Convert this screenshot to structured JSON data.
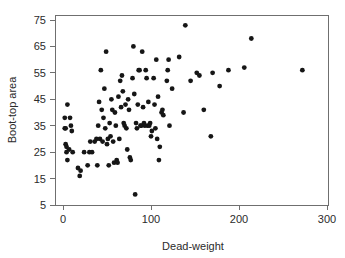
{
  "chart_data": {
    "type": "scatter",
    "title": "",
    "xlabel": "Dead-weight",
    "ylabel": "Boot-top area",
    "xlim": [
      0,
      300
    ],
    "ylim": [
      5,
      75
    ],
    "xticks": [
      0,
      100,
      200,
      300
    ],
    "yticks": [
      5,
      15,
      25,
      35,
      45,
      55,
      65,
      75
    ],
    "xtick_labels": [
      "0",
      "100",
      "200",
      "300"
    ],
    "ytick_labels": [
      "5",
      "15",
      "25",
      "35",
      "45",
      "55",
      "65",
      "75"
    ],
    "grid": false,
    "legend": false,
    "marker": "filled-circle",
    "marker_color": "#161616",
    "frame_color": "#6f6f6f",
    "n_points": 113,
    "series": [
      {
        "name": "observations",
        "points": [
          [
            2,
            38
          ],
          [
            2,
            34
          ],
          [
            3,
            34
          ],
          [
            3,
            28
          ],
          [
            4,
            27
          ],
          [
            4,
            25
          ],
          [
            5,
            43
          ],
          [
            5,
            22
          ],
          [
            7,
            26
          ],
          [
            8,
            38
          ],
          [
            9,
            35
          ],
          [
            10,
            33
          ],
          [
            11,
            25
          ],
          [
            17,
            19
          ],
          [
            19,
            16
          ],
          [
            20,
            18
          ],
          [
            24,
            25
          ],
          [
            28,
            20
          ],
          [
            30,
            25
          ],
          [
            31,
            29
          ],
          [
            33,
            25
          ],
          [
            36,
            29
          ],
          [
            38,
            30
          ],
          [
            39,
            20
          ],
          [
            40,
            35
          ],
          [
            41,
            44
          ],
          [
            42,
            30
          ],
          [
            43,
            56
          ],
          [
            44,
            41
          ],
          [
            45,
            29
          ],
          [
            46,
            38
          ],
          [
            47,
            49
          ],
          [
            48,
            34
          ],
          [
            49,
            63
          ],
          [
            50,
            28
          ],
          [
            51,
            30
          ],
          [
            52,
            20
          ],
          [
            53,
            36
          ],
          [
            54,
            31
          ],
          [
            55,
            45
          ],
          [
            56,
            41
          ],
          [
            57,
            29
          ],
          [
            58,
            21
          ],
          [
            59,
            40
          ],
          [
            60,
            35
          ],
          [
            61,
            22
          ],
          [
            62,
            21
          ],
          [
            63,
            46
          ],
          [
            64,
            30
          ],
          [
            65,
            52
          ],
          [
            66,
            42
          ],
          [
            67,
            54
          ],
          [
            68,
            48
          ],
          [
            69,
            36
          ],
          [
            70,
            35
          ],
          [
            71,
            43
          ],
          [
            72,
            34
          ],
          [
            73,
            26
          ],
          [
            74,
            45
          ],
          [
            75,
            41
          ],
          [
            76,
            23
          ],
          [
            77,
            22
          ],
          [
            79,
            53
          ],
          [
            80,
            65
          ],
          [
            81,
            47
          ],
          [
            82,
            9
          ],
          [
            83,
            36
          ],
          [
            84,
            34
          ],
          [
            85,
            43
          ],
          [
            86,
            56
          ],
          [
            87,
            56
          ],
          [
            88,
            35
          ],
          [
            89,
            35
          ],
          [
            90,
            63
          ],
          [
            91,
            42
          ],
          [
            92,
            36
          ],
          [
            93,
            35
          ],
          [
            94,
            56
          ],
          [
            95,
            53
          ],
          [
            96,
            35
          ],
          [
            97,
            44
          ],
          [
            98,
            35
          ],
          [
            99,
            36
          ],
          [
            100,
            31
          ],
          [
            101,
            33
          ],
          [
            103,
            53
          ],
          [
            104,
            43
          ],
          [
            105,
            34
          ],
          [
            106,
            60
          ],
          [
            107,
            30
          ],
          [
            108,
            46
          ],
          [
            109,
            22
          ],
          [
            110,
            27
          ],
          [
            112,
            40
          ],
          [
            113,
            41
          ],
          [
            114,
            39
          ],
          [
            118,
            52
          ],
          [
            119,
            56
          ],
          [
            120,
            60
          ],
          [
            121,
            35
          ],
          [
            124,
            49
          ],
          [
            132,
            61
          ],
          [
            137,
            40
          ],
          [
            139,
            73
          ],
          [
            145,
            52
          ],
          [
            152,
            55
          ],
          [
            155,
            54
          ],
          [
            160,
            41
          ],
          [
            168,
            31
          ],
          [
            170,
            55
          ],
          [
            178,
            50
          ],
          [
            188,
            56
          ],
          [
            206,
            57
          ],
          [
            214,
            68
          ],
          [
            272,
            56
          ]
        ]
      }
    ]
  }
}
